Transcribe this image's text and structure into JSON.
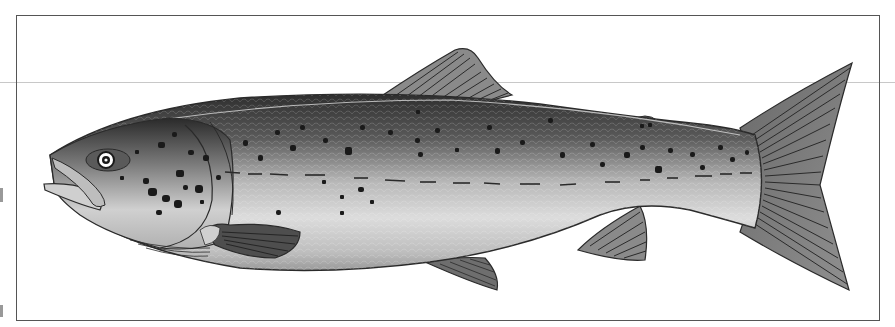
{
  "image": {
    "subject": "salmon illustration",
    "description": "Side-view grayscale illustration of a spotted salmon facing left inside a rectangular frame",
    "width": 895,
    "height": 327,
    "colors": {
      "background": "#ffffff",
      "frame": "#555555",
      "guide_line": "#c8c8c8",
      "fin_fill": "#7a7a7a",
      "fin_ray": "#2a2a2a",
      "body_dark": "#3a3a3a",
      "body_mid": "#9a9a9a",
      "body_light": "#e6e6e6",
      "spot": "#1a1a1a"
    },
    "parts": [
      "head",
      "eye",
      "mouth",
      "gill-cover",
      "pectoral-fin",
      "dorsal-fin",
      "adipose-fin",
      "pelvic-fin",
      "anal-fin",
      "caudal-fin",
      "lateral-line",
      "spots"
    ]
  }
}
